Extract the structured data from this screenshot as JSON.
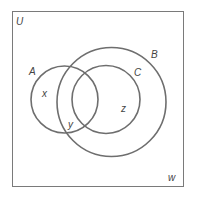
{
  "diagram": {
    "type": "venn",
    "universe_label": "U",
    "sets": [
      {
        "label": "A",
        "cx": 64.5,
        "cy": 99.5,
        "r": 33.5
      },
      {
        "label": "B",
        "cx": 111.5,
        "cy": 102,
        "r": 54.5
      },
      {
        "label": "C",
        "cx": 106,
        "cy": 99.5,
        "r": 34
      }
    ],
    "region_labels": {
      "x": "x",
      "y": "y",
      "z": "z",
      "w": "w"
    },
    "stroke_color": "#707070",
    "border_color": "#808080"
  }
}
